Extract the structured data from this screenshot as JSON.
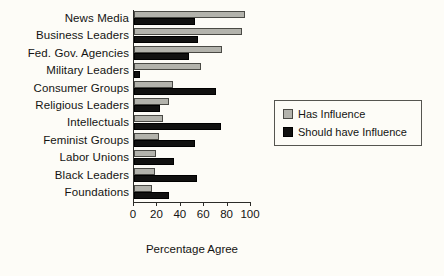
{
  "chart_data": {
    "type": "bar",
    "orientation": "horizontal",
    "title": "",
    "xlabel": "Percentage Agree",
    "ylabel": "",
    "xlim": [
      0,
      100
    ],
    "xticks": [
      0,
      20,
      40,
      60,
      80,
      100
    ],
    "xtick_labels": [
      "0",
      "20",
      "40",
      "60",
      "80",
      "100"
    ],
    "grid": false,
    "legend_position": "right",
    "categories": [
      "News Media",
      "Business Leaders",
      "Fed. Gov. Agencies",
      "Military Leaders",
      "Consumer Groups",
      "Religious Leaders",
      "Intellectuals",
      "Feminist Groups",
      "Labor Unions",
      "Black Leaders",
      "Foundations"
    ],
    "series": [
      {
        "name": "Has Influence",
        "color": "#b3b3ac",
        "values": [
          95,
          92,
          75,
          57,
          33,
          30,
          25,
          21,
          19,
          18,
          15
        ]
      },
      {
        "name": "Should have Influence",
        "color": "#111110",
        "values": [
          52,
          55,
          47,
          5,
          70,
          22,
          74,
          52,
          34,
          54,
          30
        ]
      }
    ]
  },
  "legend": {
    "items": [
      {
        "label": "Has Influence"
      },
      {
        "label": "Should have Influence"
      }
    ]
  }
}
